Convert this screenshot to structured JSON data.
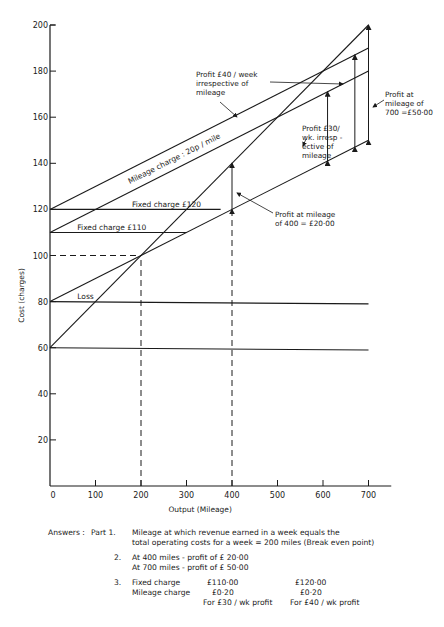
{
  "chart_data": {
    "type": "line",
    "title": "",
    "xlabel": "Output (Mileage)",
    "ylabel": "Cost (charges)",
    "xlim": [
      0,
      750
    ],
    "ylim": [
      0,
      200
    ],
    "x_ticks": [
      0,
      100,
      200,
      300,
      400,
      500,
      600,
      700
    ],
    "y_ticks": [
      20,
      40,
      60,
      80,
      100,
      120,
      140,
      160,
      180,
      200
    ],
    "grid": false,
    "series": [
      {
        "name": "Total operating cost",
        "x": [
          0,
          700
        ],
        "y": [
          80,
          150
        ]
      },
      {
        "name": "Revenue (steep)",
        "x": [
          0,
          700
        ],
        "y": [
          60,
          200
        ]
      },
      {
        "name": "Charge line £120 + mileage",
        "x": [
          0,
          700
        ],
        "y": [
          120,
          190
        ]
      },
      {
        "name": "Charge line £110 + mileage",
        "x": [
          0,
          700
        ],
        "y": [
          110,
          180
        ]
      },
      {
        "name": "Fixed charge £120",
        "x": [
          0,
          375
        ],
        "y": [
          120,
          120
        ]
      },
      {
        "name": "Fixed charge £110",
        "x": [
          0,
          300
        ],
        "y": [
          110,
          110
        ]
      },
      {
        "name": "Fixed cost 80",
        "x": [
          0,
          700
        ],
        "y": [
          80,
          79
        ]
      },
      {
        "name": "Fixed cost 60",
        "x": [
          0,
          700
        ],
        "y": [
          60,
          59
        ]
      }
    ],
    "reference_lines": [
      {
        "name": "break-even horizontal",
        "x": [
          0,
          200
        ],
        "y": [
          100,
          100
        ],
        "style": "dashed"
      },
      {
        "name": "break-even vertical",
        "x": [
          200,
          200
        ],
        "y": [
          0,
          100
        ],
        "style": "dashed"
      },
      {
        "name": "400 miles vertical",
        "x": [
          400,
          400
        ],
        "y": [
          0,
          120
        ],
        "style": "dashed"
      }
    ],
    "arrows": [
      {
        "name": "profit-400",
        "x": 400,
        "y": [
          120,
          140
        ]
      },
      {
        "name": "profit-30",
        "x": 610,
        "y": [
          141,
          171
        ]
      },
      {
        "name": "profit-40",
        "x": 670,
        "y": [
          147,
          187
        ]
      },
      {
        "name": "profit-700",
        "x": 700,
        "y": [
          150,
          200
        ]
      }
    ],
    "annotations": {
      "mileage_charge": "Mileage charge : 20p / mile",
      "fixed_120": "Fixed charge £120",
      "fixed_110": "Fixed charge £110",
      "loss": "Loss",
      "profit_40": [
        "Profit £40 / week",
        "irrespective of",
        "mileage"
      ],
      "profit_30": [
        "Profit £30/",
        "wk. irresp -",
        "ective of",
        "mileage"
      ],
      "profit_700": [
        "Profit at",
        "mileage of",
        "700 =£50·00"
      ],
      "profit_400": [
        "Profit at mileage",
        "of  400  = £20·00"
      ]
    }
  },
  "answers": {
    "heading": "Answers :",
    "part1_label": "Part 1.",
    "part1_line1": "Mileage at which revenue earned in a week equals the",
    "part1_line2": "total operating costs for a week  =  200 miles (Break even point)",
    "part2_label": "2.",
    "part2_line1": "At 400 miles - profit of £ 20·00",
    "part2_line2": "At  700 miles - profit  of £ 50·00",
    "part3_label": "3.",
    "fixed_charge_label": "Fixed charge",
    "fixed_charge_a": "£110·00",
    "fixed_charge_b": "£120·00",
    "mileage_charge_label": "Mileage charge",
    "mileage_charge_a": "£0·20",
    "mileage_charge_b": "£0·20",
    "caption_a": "For £30 / wk profit",
    "caption_b": "For £40 / wk profit"
  }
}
